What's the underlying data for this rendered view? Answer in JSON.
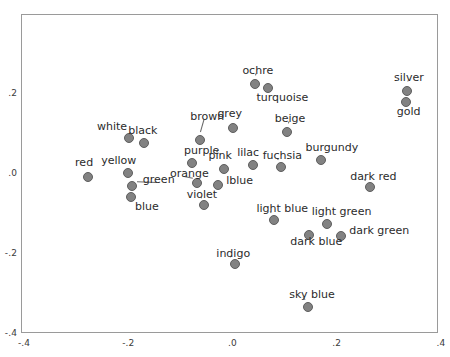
{
  "chart_data": {
    "type": "scatter",
    "title": "",
    "xlabel": "",
    "ylabel": "",
    "xlim": [
      -0.4,
      0.4
    ],
    "ylim": [
      -0.4,
      0.4
    ],
    "grid": false,
    "legend": "none",
    "xticks": [
      "-.4",
      "-.2",
      ".0",
      ".2",
      ".4"
    ],
    "xtick_values": [
      -0.4,
      -0.2,
      0.0,
      0.2,
      0.4
    ],
    "yticks": [
      ".2",
      ".0",
      "-.2",
      "-.4"
    ],
    "ytick_values": [
      0.2,
      0.0,
      -0.2,
      -0.4
    ],
    "point_style": {
      "marker": "circle",
      "fill": "#828282",
      "edge": "#5e5e5e",
      "size_px": 10
    },
    "points": [
      {
        "label": "red",
        "x": -0.277,
        "y": -0.009,
        "lx": -0.302,
        "ly": 0.025,
        "leader": false
      },
      {
        "label": "white",
        "x": -0.198,
        "y": 0.087,
        "lx": -0.26,
        "ly": 0.116,
        "leader": false
      },
      {
        "label": "black",
        "x": -0.17,
        "y": 0.076,
        "lx": -0.2,
        "ly": 0.105,
        "leader": false
      },
      {
        "label": "yellow",
        "x": -0.2,
        "y": -0.0,
        "lx": -0.252,
        "ly": 0.029,
        "leader": false
      },
      {
        "label": "green",
        "x": -0.192,
        "y": -0.033,
        "lx": -0.172,
        "ly": -0.018,
        "leader": true
      },
      {
        "label": "blue",
        "x": -0.194,
        "y": -0.061,
        "lx": -0.187,
        "ly": -0.086,
        "leader": false
      },
      {
        "label": "brown",
        "x": -0.063,
        "y": 0.082,
        "lx": -0.081,
        "ly": 0.14,
        "leader": true
      },
      {
        "label": "grey",
        "x": 0.0,
        "y": 0.113,
        "lx": -0.029,
        "ly": 0.148,
        "leader": false
      },
      {
        "label": "purple",
        "x": -0.077,
        "y": 0.024,
        "lx": -0.093,
        "ly": 0.055,
        "leader": false
      },
      {
        "label": "pink",
        "x": -0.016,
        "y": 0.011,
        "lx": -0.046,
        "ly": 0.043,
        "leader": false
      },
      {
        "label": "lilac",
        "x": 0.039,
        "y": 0.02,
        "lx": 0.009,
        "ly": 0.051,
        "leader": false
      },
      {
        "label": "orange",
        "x": -0.069,
        "y": -0.026,
        "lx": -0.12,
        "ly": -0.002,
        "leader": true
      },
      {
        "label": "lblue",
        "x": -0.028,
        "y": -0.031,
        "lx": -0.012,
        "ly": -0.02,
        "leader": false
      },
      {
        "label": "violet",
        "x": -0.054,
        "y": -0.079,
        "lx": -0.088,
        "ly": -0.056,
        "leader": true
      },
      {
        "label": "ochre",
        "x": 0.043,
        "y": 0.224,
        "lx": 0.019,
        "ly": 0.256,
        "leader": true
      },
      {
        "label": "turquoise",
        "x": 0.069,
        "y": 0.213,
        "lx": 0.046,
        "ly": 0.188,
        "leader": false
      },
      {
        "label": "beige",
        "x": 0.104,
        "y": 0.102,
        "lx": 0.081,
        "ly": 0.135,
        "leader": true
      },
      {
        "label": "fuchsia",
        "x": 0.093,
        "y": 0.014,
        "lx": 0.058,
        "ly": 0.042,
        "leader": true
      },
      {
        "label": "burgundy",
        "x": 0.17,
        "y": 0.032,
        "lx": 0.14,
        "ly": 0.063,
        "leader": false
      },
      {
        "label": "silver",
        "x": 0.335,
        "y": 0.206,
        "lx": 0.31,
        "ly": 0.237,
        "leader": true
      },
      {
        "label": "gold",
        "x": 0.333,
        "y": 0.177,
        "lx": 0.315,
        "ly": 0.152,
        "leader": false
      },
      {
        "label": "dark red",
        "x": 0.263,
        "y": -0.036,
        "lx": 0.226,
        "ly": -0.01,
        "leader": true
      },
      {
        "label": "light blue",
        "x": 0.08,
        "y": -0.119,
        "lx": 0.046,
        "ly": -0.091,
        "leader": true
      },
      {
        "label": "dark blue",
        "x": 0.147,
        "y": -0.156,
        "lx": 0.111,
        "ly": -0.173,
        "leader": false
      },
      {
        "label": "light green",
        "x": 0.182,
        "y": -0.128,
        "lx": 0.152,
        "ly": -0.099,
        "leader": true
      },
      {
        "label": "dark green",
        "x": 0.208,
        "y": -0.157,
        "lx": 0.224,
        "ly": -0.146,
        "leader": false
      },
      {
        "label": "indigo",
        "x": 0.004,
        "y": -0.229,
        "lx": -0.031,
        "ly": -0.203,
        "leader": true
      },
      {
        "label": "sky blue",
        "x": 0.145,
        "y": -0.335,
        "lx": 0.109,
        "ly": -0.306,
        "leader": true
      }
    ]
  }
}
